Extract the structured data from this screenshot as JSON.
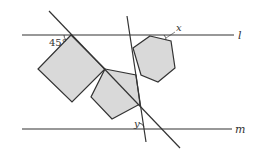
{
  "diagram": {
    "type": "geometry",
    "lines": {
      "l": {
        "label": "l",
        "y": 35
      },
      "m": {
        "label": "m",
        "y": 129
      }
    },
    "angles": {
      "given": "45°",
      "unknown_x": "x",
      "unknown_y": "y"
    },
    "shapes": [
      "square",
      "pentagon",
      "hexagon"
    ],
    "colors": {
      "fill": "#d9d9d9",
      "stroke": "#333333"
    }
  }
}
